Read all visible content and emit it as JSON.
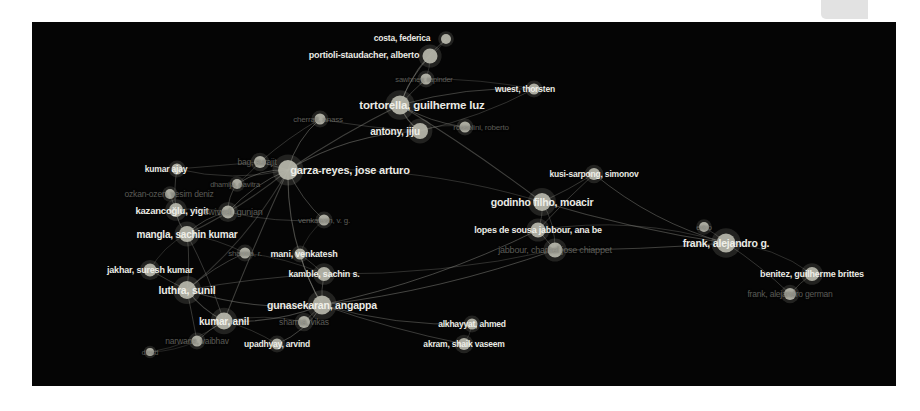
{
  "app": {
    "title": "VOSviewer co-authorship network",
    "canvas_background": "#050505",
    "node_color": "#b9b9ad",
    "edge_color": "#8d8d86",
    "label_color_bright": "#f2f2ec",
    "label_color_dim": "#8e8e86",
    "page_background": "#ffffff"
  },
  "corner_notch": {
    "name": "canvas-corner-notch",
    "color": "#e2e2e2",
    "x": 821,
    "y": 0,
    "width": 47,
    "height": 19
  },
  "chart_data": {
    "type": "scatter",
    "xlabel": "",
    "ylabel": "",
    "xlim": [
      0,
      864
    ],
    "ylim": [
      0,
      364
    ],
    "grid": false,
    "legend": null,
    "node_count": 55,
    "edge_count": 78,
    "nodes": [
      {
        "id": "costa-federica",
        "label": "costa, federica",
        "x": 414,
        "y": 17,
        "r": 5.0,
        "weight": 6,
        "font": 8.5,
        "tone": "bright",
        "label_dx": -44,
        "label_dy": -1
      },
      {
        "id": "portioli-staudacher-alberto",
        "label": "portioli-staudacher, alberto",
        "x": 398,
        "y": 34,
        "r": 7.5,
        "weight": 11,
        "font": 9.0,
        "tone": "bright",
        "label_dx": -66,
        "label_dy": -1
      },
      {
        "id": "sawhney-rapinder",
        "label": "sawhney, rapinder",
        "x": 394,
        "y": 57,
        "r": 5.5,
        "weight": 5,
        "font": 7.5,
        "tone": "dim",
        "label_dx": -2,
        "label_dy": 0
      },
      {
        "id": "wuest-thorsten",
        "label": "wuest, thorsten",
        "x": 502,
        "y": 67,
        "r": 5.5,
        "weight": 7,
        "font": 8.5,
        "tone": "bright",
        "label_dx": -9,
        "label_dy": 0
      },
      {
        "id": "tortorella-guilherme-luz",
        "label": "tortorella, guilherme luz",
        "x": 368,
        "y": 83,
        "r": 9.5,
        "weight": 16,
        "font": 11.5,
        "tone": "bright",
        "label_dx": 22,
        "label_dy": 0
      },
      {
        "id": "sassanelli-claudio",
        "label": "rossolini, roberto",
        "x": 433,
        "y": 105,
        "r": 5.5,
        "weight": 5,
        "font": 8.0,
        "tone": "dim",
        "label_dx": 16,
        "label_dy": 0
      },
      {
        "id": "cherrafi-anass",
        "label": "cherrafi, anass",
        "x": 288,
        "y": 97,
        "r": 5.5,
        "weight": 6,
        "font": 8.0,
        "tone": "dim",
        "label_dx": -2,
        "label_dy": 0
      },
      {
        "id": "antony-jiju",
        "label": "antony, jiju",
        "x": 388,
        "y": 109,
        "r": 8.0,
        "weight": 13,
        "font": 10.0,
        "tone": "bright",
        "label_dx": -25,
        "label_dy": 0
      },
      {
        "id": "garza-reyes-jose-arturo",
        "label": "garza-reyes, jose arturo",
        "x": 256,
        "y": 148,
        "r": 10.0,
        "weight": 18,
        "font": 11.0,
        "tone": "bright",
        "label_dx": 62,
        "label_dy": 0
      },
      {
        "id": "bag-surajit",
        "label": "bag, surajit",
        "x": 228,
        "y": 140,
        "r": 6.0,
        "weight": 6,
        "font": 8.5,
        "tone": "dim",
        "label_dx": -3,
        "label_dy": 0
      },
      {
        "id": "kumar-ajay",
        "label": "kumar ajay",
        "x": 145,
        "y": 147,
        "r": 5.5,
        "weight": 6,
        "font": 8.5,
        "tone": "bright",
        "label_dx": -11,
        "label_dy": 0
      },
      {
        "id": "dhamija-pavitra",
        "label": "dhamija, pavitra",
        "x": 205,
        "y": 162,
        "r": 5.0,
        "weight": 5,
        "font": 7.5,
        "tone": "dim",
        "label_dx": -2,
        "label_dy": 0
      },
      {
        "id": "ozkan-ozen-yesim-deniz",
        "label": "ozkan-ozen, yesim deniz",
        "x": 138,
        "y": 172,
        "r": 5.0,
        "weight": 5,
        "font": 8.5,
        "tone": "dim",
        "label_dx": -1,
        "label_dy": 0
      },
      {
        "id": "kazancoglu-yigit",
        "label": "kazancoğlu, yigit",
        "x": 144,
        "y": 188,
        "r": 7.0,
        "weight": 10,
        "font": 9.5,
        "tone": "bright",
        "label_dx": -4,
        "label_dy": 0
      },
      {
        "id": "dwivedi-gunjan",
        "label": "dwivedi, gunjan",
        "x": 196,
        "y": 190,
        "r": 6.5,
        "weight": 7,
        "font": 9.0,
        "tone": "dim",
        "label_dx": 5,
        "label_dy": 0
      },
      {
        "id": "venkatesh-vg",
        "label": "venkatesh, v. g.",
        "x": 292,
        "y": 198,
        "r": 5.5,
        "weight": 5,
        "font": 8.0,
        "tone": "dim",
        "label_dx": 0,
        "label_dy": 0
      },
      {
        "id": "mangla-sachin-kumar",
        "label": "mangla, sachin kumar",
        "x": 155,
        "y": 212,
        "r": 8.0,
        "weight": 12,
        "font": 10.0,
        "tone": "bright",
        "label_dx": 0,
        "label_dy": 0
      },
      {
        "id": "mani-venkatesh",
        "label": "mani, venkatesh",
        "x": 268,
        "y": 232,
        "r": 5.5,
        "weight": 7,
        "font": 9.0,
        "tone": "bright",
        "label_dx": 4,
        "label_dy": 0
      },
      {
        "id": "sharma-r",
        "label": "sharma, r.",
        "x": 213,
        "y": 231,
        "r": 5.5,
        "weight": 5,
        "font": 8.0,
        "tone": "dim",
        "label_dx": 0,
        "label_dy": 0
      },
      {
        "id": "jakhar-suresh-kumar",
        "label": "jakhar, suresh kumar",
        "x": 118,
        "y": 248,
        "r": 6.5,
        "weight": 8,
        "font": 9.0,
        "tone": "bright",
        "label_dx": 0,
        "label_dy": 0
      },
      {
        "id": "kamble-sachin-s",
        "label": "kamble, sachin s.",
        "x": 292,
        "y": 252,
        "r": 7.0,
        "weight": 9,
        "font": 9.0,
        "tone": "bright",
        "label_dx": 0,
        "label_dy": 0
      },
      {
        "id": "luthra-sunil",
        "label": "luthra, sunil",
        "x": 155,
        "y": 268,
        "r": 9.0,
        "weight": 15,
        "font": 10.5,
        "tone": "bright",
        "label_dx": 0,
        "label_dy": 0
      },
      {
        "id": "gunasekaran-angappa",
        "label": "gunasekaran, angappa",
        "x": 290,
        "y": 283,
        "r": 9.5,
        "weight": 15,
        "font": 10.5,
        "tone": "bright",
        "label_dx": 0,
        "label_dy": 0
      },
      {
        "id": "kumar-anil",
        "label": "kumar, anil",
        "x": 192,
        "y": 299,
        "r": 8.5,
        "weight": 13,
        "font": 10.0,
        "tone": "bright",
        "label_dx": 0,
        "label_dy": 0
      },
      {
        "id": "sharma-vikas",
        "label": "sharma, vikas",
        "x": 272,
        "y": 300,
        "r": 6.0,
        "weight": 6,
        "font": 8.5,
        "tone": "dim",
        "label_dx": 0,
        "label_dy": 0
      },
      {
        "id": "narwane-vaibhav",
        "label": "narwane, vaibhav",
        "x": 165,
        "y": 319,
        "r": 5.5,
        "weight": 6,
        "font": 8.5,
        "tone": "dim",
        "label_dx": 0,
        "label_dy": 0
      },
      {
        "id": "upadhyay-arvind",
        "label": "upadhyay, arvind",
        "x": 245,
        "y": 322,
        "r": 5.5,
        "weight": 6,
        "font": 8.5,
        "tone": "bright",
        "label_dx": 0,
        "label_dy": 0
      },
      {
        "id": "dmsd",
        "label": "dmsd",
        "x": 118,
        "y": 330,
        "r": 4.0,
        "weight": 3,
        "font": 7.0,
        "tone": "dim",
        "label_dx": 0,
        "label_dy": 0
      },
      {
        "id": "kusi-sarpong-simonov",
        "label": "kusi-sarpong, simonov",
        "x": 562,
        "y": 152,
        "r": 6.0,
        "weight": 8,
        "font": 8.5,
        "tone": "bright",
        "label_dx": 0,
        "label_dy": 0
      },
      {
        "id": "godinho-filho-moacir",
        "label": "godinho filho, moacir",
        "x": 510,
        "y": 180,
        "r": 9.0,
        "weight": 15,
        "font": 10.5,
        "tone": "bright",
        "label_dx": 0,
        "label_dy": 0
      },
      {
        "id": "lopes-de-sousa-jabbour",
        "label": "lopes de sousa jabbour, ana be",
        "x": 506,
        "y": 208,
        "r": 7.5,
        "weight": 12,
        "font": 9.0,
        "tone": "bright",
        "label_dx": 0,
        "label_dy": 0
      },
      {
        "id": "jabbour-charbel",
        "label": "jabbour, charbel jose chiappet",
        "x": 523,
        "y": 228,
        "r": 7.5,
        "weight": 12,
        "font": 9.0,
        "tone": "dim",
        "label_dx": 0,
        "label_dy": 0
      },
      {
        "id": "frank-alejandro-g",
        "label": "frank, alejandro g.",
        "x": 694,
        "y": 221,
        "r": 9.5,
        "weight": 15,
        "font": 10.5,
        "tone": "bright",
        "label_dx": 0,
        "label_dy": 0
      },
      {
        "id": "erico",
        "label": "erico",
        "x": 672,
        "y": 205,
        "r": 5.0,
        "weight": 4,
        "font": 7.5,
        "tone": "dim",
        "label_dx": 0,
        "label_dy": 0
      },
      {
        "id": "benitez-guilherme-brittes",
        "label": "benitez, guilherme brittes",
        "x": 780,
        "y": 252,
        "r": 7.0,
        "weight": 10,
        "font": 9.0,
        "tone": "bright",
        "label_dx": 0,
        "label_dy": 0
      },
      {
        "id": "frank-alejandro-german",
        "label": "frank, alejandro german",
        "x": 758,
        "y": 272,
        "r": 6.0,
        "weight": 7,
        "font": 8.5,
        "tone": "dim",
        "label_dx": 0,
        "label_dy": 0
      },
      {
        "id": "alkhayyat-ahmed",
        "label": "alkhayyat, ahmed",
        "x": 440,
        "y": 302,
        "r": 5.5,
        "weight": 6,
        "font": 8.5,
        "tone": "bright",
        "label_dx": 0,
        "label_dy": 0
      },
      {
        "id": "akram-shaik-vaseem",
        "label": "akram, shaik vaseem",
        "x": 432,
        "y": 322,
        "r": 6.0,
        "weight": 7,
        "font": 8.5,
        "tone": "bright",
        "label_dx": 0,
        "label_dy": 0
      }
    ],
    "edges": [
      [
        "costa-federica",
        "portioli-staudacher-alberto"
      ],
      [
        "portioli-staudacher-alberto",
        "tortorella-guilherme-luz"
      ],
      [
        "portioli-staudacher-alberto",
        "sawhney-rapinder"
      ],
      [
        "sawhney-rapinder",
        "tortorella-guilherme-luz"
      ],
      [
        "sawhney-rapinder",
        "wuest-thorsten"
      ],
      [
        "wuest-thorsten",
        "tortorella-guilherme-luz"
      ],
      [
        "tortorella-guilherme-luz",
        "antony-jiju"
      ],
      [
        "tortorella-guilherme-luz",
        "sassanelli-claudio"
      ],
      [
        "tortorella-guilherme-luz",
        "garza-reyes-jose-arturo"
      ],
      [
        "antony-jiju",
        "garza-reyes-jose-arturo"
      ],
      [
        "antony-jiju",
        "cherrafi-anass"
      ],
      [
        "cherrafi-anass",
        "garza-reyes-jose-arturo"
      ],
      [
        "cherrafi-anass",
        "bag-surajit"
      ],
      [
        "garza-reyes-jose-arturo",
        "bag-surajit"
      ],
      [
        "garza-reyes-jose-arturo",
        "kumar-ajay"
      ],
      [
        "garza-reyes-jose-arturo",
        "dhamija-pavitra"
      ],
      [
        "garza-reyes-jose-arturo",
        "dwivedi-gunjan"
      ],
      [
        "garza-reyes-jose-arturo",
        "mangla-sachin-kumar"
      ],
      [
        "garza-reyes-jose-arturo",
        "luthra-sunil"
      ],
      [
        "garza-reyes-jose-arturo",
        "kumar-anil"
      ],
      [
        "garza-reyes-jose-arturo",
        "gunasekaran-angappa"
      ],
      [
        "garza-reyes-jose-arturo",
        "godinho-filho-moacir"
      ],
      [
        "bag-surajit",
        "kumar-ajay"
      ],
      [
        "bag-surajit",
        "dhamija-pavitra"
      ],
      [
        "dhamija-pavitra",
        "dwivedi-gunjan"
      ],
      [
        "kumar-ajay",
        "kazancoglu-yigit"
      ],
      [
        "ozkan-ozen-yesim-deniz",
        "kazancoglu-yigit"
      ],
      [
        "kazancoglu-yigit",
        "mangla-sachin-kumar"
      ],
      [
        "kazancoglu-yigit",
        "dwivedi-gunjan"
      ],
      [
        "dwivedi-gunjan",
        "venkatesh-vg"
      ],
      [
        "dwivedi-gunjan",
        "mangla-sachin-kumar"
      ],
      [
        "mangla-sachin-kumar",
        "luthra-sunil"
      ],
      [
        "mangla-sachin-kumar",
        "sharma-r"
      ],
      [
        "mangla-sachin-kumar",
        "kumar-anil"
      ],
      [
        "sharma-r",
        "luthra-sunil"
      ],
      [
        "sharma-r",
        "kamble-sachin-s"
      ],
      [
        "jakhar-suresh-kumar",
        "luthra-sunil"
      ],
      [
        "jakhar-suresh-kumar",
        "mangla-sachin-kumar"
      ],
      [
        "luthra-sunil",
        "kumar-anil"
      ],
      [
        "luthra-sunil",
        "gunasekaran-angappa"
      ],
      [
        "luthra-sunil",
        "narwane-vaibhav"
      ],
      [
        "luthra-sunil",
        "kamble-sachin-s"
      ],
      [
        "kamble-sachin-s",
        "gunasekaran-angappa"
      ],
      [
        "kamble-sachin-s",
        "mani-venkatesh"
      ],
      [
        "mani-venkatesh",
        "venkatesh-vg"
      ],
      [
        "mani-venkatesh",
        "gunasekaran-angappa"
      ],
      [
        "kumar-anil",
        "gunasekaran-angappa"
      ],
      [
        "kumar-anil",
        "narwane-vaibhav"
      ],
      [
        "kumar-anil",
        "upadhyay-arvind"
      ],
      [
        "kumar-anil",
        "sharma-vikas"
      ],
      [
        "kumar-anil",
        "dmsd"
      ],
      [
        "narwane-vaibhav",
        "dmsd"
      ],
      [
        "sharma-vikas",
        "gunasekaran-angappa"
      ],
      [
        "upadhyay-arvind",
        "gunasekaran-angappa"
      ],
      [
        "gunasekaran-angappa",
        "alkhayyat-ahmed"
      ],
      [
        "gunasekaran-angappa",
        "akram-shaik-vaseem"
      ],
      [
        "gunasekaran-angappa",
        "lopes-de-sousa-jabbour"
      ],
      [
        "gunasekaran-angappa",
        "jabbour-charbel"
      ],
      [
        "alkhayyat-ahmed",
        "akram-shaik-vaseem"
      ],
      [
        "kusi-sarpong-simonov",
        "godinho-filho-moacir"
      ],
      [
        "kusi-sarpong-simonov",
        "lopes-de-sousa-jabbour"
      ],
      [
        "godinho-filho-moacir",
        "lopes-de-sousa-jabbour"
      ],
      [
        "godinho-filho-moacir",
        "jabbour-charbel"
      ],
      [
        "godinho-filho-moacir",
        "frank-alejandro-g"
      ],
      [
        "godinho-filho-moacir",
        "tortorella-guilherme-luz"
      ],
      [
        "lopes-de-sousa-jabbour",
        "jabbour-charbel"
      ],
      [
        "lopes-de-sousa-jabbour",
        "frank-alejandro-g"
      ],
      [
        "jabbour-charbel",
        "frank-alejandro-g"
      ],
      [
        "jabbour-charbel",
        "kamble-sachin-s"
      ],
      [
        "erico",
        "frank-alejandro-g"
      ],
      [
        "frank-alejandro-g",
        "benitez-guilherme-brittes"
      ],
      [
        "frank-alejandro-g",
        "frank-alejandro-german"
      ],
      [
        "benitez-guilherme-brittes",
        "frank-alejandro-german"
      ],
      [
        "antony-jiju",
        "sassanelli-claudio"
      ],
      [
        "costa-federica",
        "tortorella-guilherme-luz"
      ],
      [
        "wuest-thorsten",
        "antony-jiju"
      ],
      [
        "garza-reyes-jose-arturo",
        "venkatesh-vg"
      ],
      [
        "kusi-sarpong-simonov",
        "frank-alejandro-g"
      ]
    ]
  }
}
